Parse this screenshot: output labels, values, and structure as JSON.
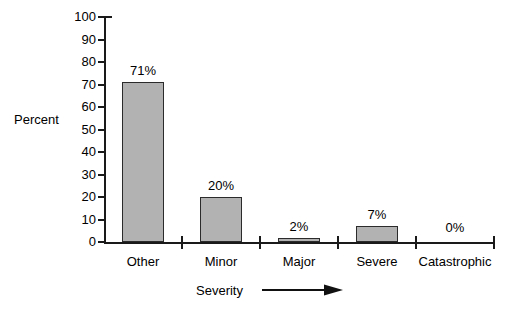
{
  "chart_data": {
    "type": "bar",
    "title": "",
    "subtitle": "",
    "xlabel": "Severity",
    "ylabel": "Percent",
    "categories": [
      "Other",
      "Minor",
      "Major",
      "Severe",
      "Catastrophic"
    ],
    "values": [
      71,
      20,
      2,
      7,
      0
    ],
    "data_labels": [
      "71%",
      "20%",
      "2%",
      "7%",
      "0%"
    ],
    "ylim": [
      0,
      100
    ],
    "ytick_values": [
      0,
      10,
      20,
      30,
      40,
      50,
      60,
      70,
      80,
      90,
      100
    ],
    "ytick_labels": [
      "0",
      "10",
      "20",
      "30",
      "40",
      "50",
      "60",
      "70",
      "80",
      "90",
      "100"
    ],
    "grid": false,
    "legend": false,
    "legend_position": "none",
    "xlabel_arrow": "right-arrow",
    "colors": {
      "bar_fill": "#b2b2b2",
      "bar_edge": "#2b2b2b",
      "axis": "#1a1a1a",
      "text": "#000000",
      "background": "#ffffff"
    }
  },
  "axes": {
    "y_title": "Percent",
    "x_title": "Severity"
  }
}
